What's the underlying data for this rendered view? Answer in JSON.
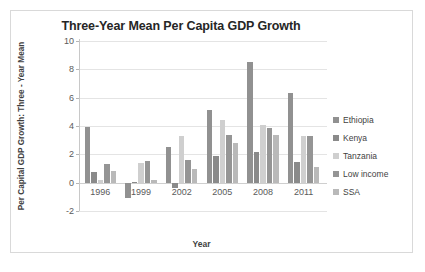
{
  "chart_data": {
    "type": "bar",
    "title": "Three-Year Mean Per Capita GDP Growth",
    "xlabel": "Year",
    "ylabel": "Per Capital GDP Growth: Three - Year Mean",
    "categories": [
      "1996",
      "1999",
      "2002",
      "2005",
      "2008",
      "2011"
    ],
    "ylim": [
      -2,
      10
    ],
    "yticks": [
      "10",
      "8",
      "6",
      "4",
      "2",
      "0",
      "-2"
    ],
    "ytick_values": [
      10,
      8,
      6,
      4,
      2,
      0,
      -2
    ],
    "grid": true,
    "legend_position": "right",
    "series": [
      {
        "name": "Ethiopia",
        "color": "#919191",
        "values": [
          3.9,
          -1.1,
          2.55,
          5.1,
          8.5,
          6.3
        ]
      },
      {
        "name": "Kenya",
        "color": "#8a8a8a",
        "values": [
          0.75,
          0.05,
          -0.35,
          1.9,
          2.2,
          1.45
        ]
      },
      {
        "name": "Tanzania",
        "color": "#cfcfcf",
        "values": [
          0.2,
          1.4,
          3.3,
          4.45,
          4.05,
          3.3
        ]
      },
      {
        "name": "Low income",
        "color": "#959595",
        "values": [
          1.3,
          1.55,
          1.6,
          3.35,
          3.85,
          3.3
        ]
      },
      {
        "name": "SSA",
        "color": "#b9b9b9",
        "values": [
          0.85,
          0.2,
          0.95,
          2.8,
          3.35,
          1.1
        ]
      }
    ]
  }
}
